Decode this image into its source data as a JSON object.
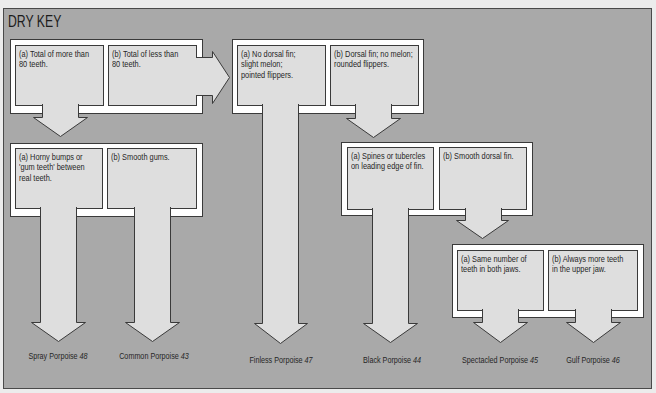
{
  "title": "DRY KEY",
  "colors": {
    "panel_background": "#a9a9a9",
    "box_fill": "#dedede",
    "frame_fill": "#ffffff",
    "outline": "#3a3a3a",
    "text": "#262626"
  },
  "couplets": [
    {
      "a": {
        "lines": [
          "(a) Total of more than",
          "80 teeth."
        ]
      },
      "b": {
        "lines": [
          "(b) Total of less than",
          "80 teeth."
        ]
      }
    },
    {
      "a": {
        "lines": [
          "(a) Horny bumps or",
          "'gum teeth' between",
          "real teeth."
        ]
      },
      "b": {
        "lines": [
          "(b) Smooth gums."
        ]
      }
    },
    {
      "a": {
        "lines": [
          "(a) No dorsal fin;",
          "slight melon;",
          "pointed flippers."
        ]
      },
      "b": {
        "lines": [
          "(b) Dorsal fin; no melon;",
          "rounded flippers."
        ]
      }
    },
    {
      "a": {
        "lines": [
          "(a) Spines or tubercles",
          "on leading edge of fin."
        ]
      },
      "b": {
        "lines": [
          "(b) Smooth dorsal fin."
        ]
      }
    },
    {
      "a": {
        "lines": [
          "(a) Same number of",
          "teeth in both jaws."
        ]
      },
      "b": {
        "lines": [
          "(b) Always more teeth",
          "in the upper jaw."
        ]
      }
    }
  ],
  "results": [
    {
      "name": "Spray Porpoise ",
      "page": "48"
    },
    {
      "name": "Common Porpoise ",
      "page": "43"
    },
    {
      "name": "Finless Porpoise ",
      "page": "47"
    },
    {
      "name": "Black Porpoise ",
      "page": "44"
    },
    {
      "name": "Spectacled Porpoise ",
      "page": "45"
    },
    {
      "name": "Gulf Porpoise ",
      "page": "46"
    }
  ]
}
